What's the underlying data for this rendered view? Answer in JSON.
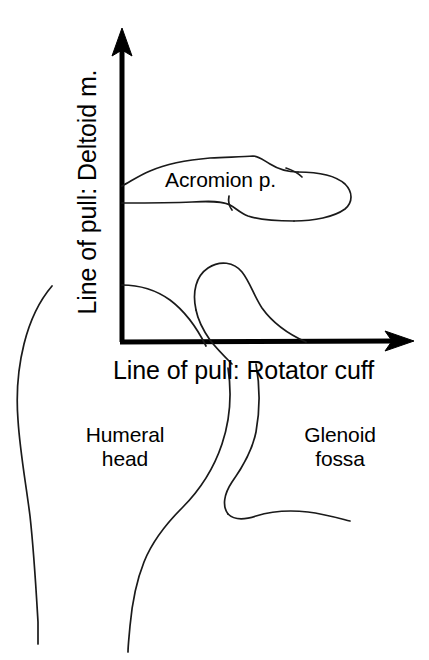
{
  "figure": {
    "kind": "anatomical-line-diagram",
    "background_color": "#ffffff",
    "line_color": "#1a1a1a",
    "axis_color": "#000000",
    "text_color": "#000000"
  },
  "axes": {
    "vertical": {
      "label": "Line of pull: Deltoid m.",
      "orientation": "vertical",
      "arrow_direction": "up",
      "arrow_tip": {
        "x": 122,
        "y": 32
      },
      "origin": {
        "x": 122,
        "y": 342
      }
    },
    "horizontal": {
      "label": "Line of pull: Rotator cuff",
      "orientation": "horizontal",
      "arrow_direction": "right",
      "arrow_tip": {
        "x": 412,
        "y": 340
      },
      "origin": {
        "x": 122,
        "y": 342
      }
    }
  },
  "annotations": [
    {
      "id": "acromion",
      "label": "Acromion p.",
      "structure": "acromion process"
    },
    {
      "id": "humeral-head",
      "label": "Humeral\nhead",
      "line1": "Humeral",
      "line2": "head",
      "structure": "humeral head"
    },
    {
      "id": "glenoid-fossa",
      "label": "Glenoid\nfossa",
      "line1": "Glenoid",
      "line2": "fossa",
      "structure": "glenoid fossa"
    }
  ],
  "labels": {
    "y_axis": "Line of pull: Deltoid m.",
    "x_axis": "Line of pull: Rotator cuff",
    "acromion": "Acromion p.",
    "humeral_head": "Humeral\nhead",
    "glenoid_fossa": "Glenoid\nfossa"
  }
}
